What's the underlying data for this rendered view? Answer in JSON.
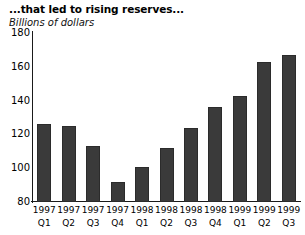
{
  "chart_data": {
    "type": "bar",
    "title": "...that led to rising reserves...",
    "subtitle": "Billions of dollars",
    "xlabel": "",
    "ylabel": "Billions of dollars",
    "ylim": [
      80,
      180
    ],
    "yticks": [
      80,
      100,
      120,
      140,
      160,
      180
    ],
    "grid": false,
    "legend": false,
    "bar_color": "#3a3a3a",
    "axis_color": "#1a1a1a",
    "categories": [
      "1997 Q1",
      "1997 Q2",
      "1997 Q3",
      "1997 Q4",
      "1998 Q1",
      "1998 Q2",
      "1998 Q3",
      "1998 Q4",
      "1999 Q1",
      "1999 Q2",
      "1999 Q3"
    ],
    "category_years": [
      "1997",
      "1997",
      "1997",
      "1997",
      "1998",
      "1998",
      "1998",
      "1998",
      "1999",
      "1999",
      "1999"
    ],
    "category_quarters": [
      "Q1",
      "Q2",
      "Q3",
      "Q4",
      "Q1",
      "Q2",
      "Q3",
      "Q4",
      "Q1",
      "Q2",
      "Q3"
    ],
    "values": [
      126,
      125,
      113,
      92,
      101,
      112,
      124,
      136,
      143,
      163,
      167
    ]
  }
}
